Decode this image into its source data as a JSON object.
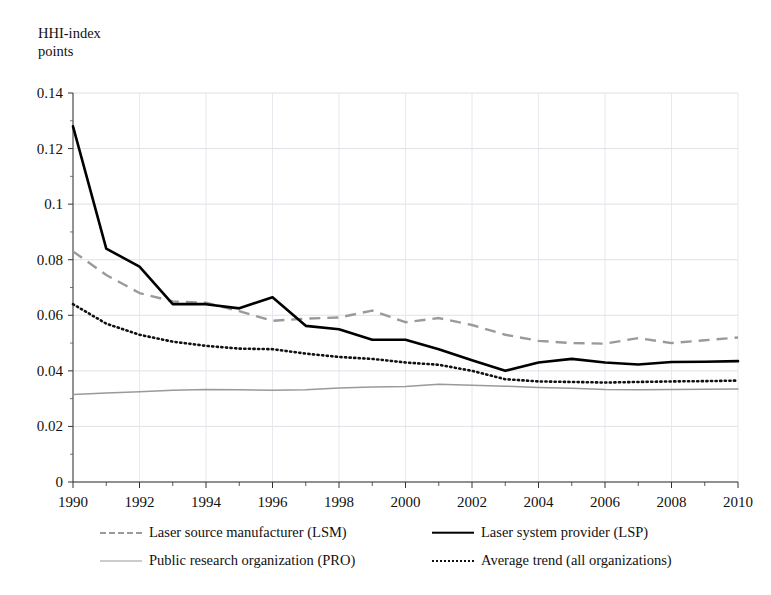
{
  "axis_title": "HHI-index\npoints",
  "legend": [
    {
      "key": "lsm",
      "label": "Laser source manufacturer (LSM)",
      "style": "dashed",
      "color": "#9a9a9a"
    },
    {
      "key": "lsp",
      "label": "Laser system provider (LSP)",
      "style": "solid-thick",
      "color": "#000000"
    },
    {
      "key": "pro",
      "label": "Public research organization (PRO)",
      "style": "solid-thin",
      "color": "#9a9a9a"
    },
    {
      "key": "avg",
      "label": "Average trend (all organizations)",
      "style": "dotted",
      "color": "#111111"
    }
  ],
  "chart_data": {
    "type": "line",
    "title": "",
    "xlabel": "",
    "ylabel": "HHI-index points",
    "xlim": [
      1990,
      2010
    ],
    "ylim": [
      0,
      0.14
    ],
    "ytick_labels": [
      "0",
      "0.02",
      "0.04",
      "0.06",
      "0.08",
      "0.1",
      "0.12",
      "0.14"
    ],
    "ytick_values": [
      0,
      0.02,
      0.04,
      0.06,
      0.08,
      0.1,
      0.12,
      0.14
    ],
    "xtick_labels": [
      "1990",
      "1992",
      "1994",
      "1996",
      "1998",
      "2000",
      "2002",
      "2004",
      "2006",
      "2008",
      "2010"
    ],
    "xtick_values": [
      1990,
      1992,
      1994,
      1996,
      1998,
      2000,
      2002,
      2004,
      2006,
      2008,
      2010
    ],
    "minor_xticks_every": 1,
    "grid": "horizontal-and-vertical-light",
    "legend_position": "bottom",
    "x": [
      1990,
      1991,
      1992,
      1993,
      1994,
      1995,
      1996,
      1997,
      1998,
      1999,
      2000,
      2001,
      2002,
      2003,
      2004,
      2005,
      2006,
      2007,
      2008,
      2009,
      2010
    ],
    "series": [
      {
        "name": "Laser source manufacturer (LSM)",
        "short": "LSM",
        "style": "dashed",
        "color": "#9a9a9a",
        "values": [
          0.083,
          0.0745,
          0.068,
          0.065,
          0.0645,
          0.0615,
          0.058,
          0.0588,
          0.0592,
          0.0617,
          0.0575,
          0.059,
          0.0565,
          0.053,
          0.0508,
          0.05,
          0.0498,
          0.0518,
          0.05,
          0.051,
          0.052
        ]
      },
      {
        "name": "Laser system provider (LSP)",
        "short": "LSP",
        "style": "solid-thick",
        "color": "#000000",
        "values": [
          0.128,
          0.084,
          0.0775,
          0.064,
          0.064,
          0.0625,
          0.0665,
          0.0562,
          0.055,
          0.0512,
          0.0512,
          0.0478,
          0.0438,
          0.04,
          0.043,
          0.0443,
          0.043,
          0.0423,
          0.0432,
          0.0433,
          0.0435
        ]
      },
      {
        "name": "Public research organization (PRO)",
        "short": "PRO",
        "style": "solid-thin",
        "color": "#9a9a9a",
        "values": [
          0.0315,
          0.032,
          0.0325,
          0.033,
          0.0333,
          0.0332,
          0.033,
          0.0332,
          0.0338,
          0.0342,
          0.0344,
          0.0352,
          0.0348,
          0.0345,
          0.034,
          0.0337,
          0.0333,
          0.0332,
          0.0333,
          0.0334,
          0.0335
        ]
      },
      {
        "name": "Average trend (all organizations)",
        "short": "Average trend",
        "style": "dotted",
        "color": "#111111",
        "values": [
          0.064,
          0.057,
          0.053,
          0.0505,
          0.049,
          0.048,
          0.0478,
          0.0462,
          0.045,
          0.0443,
          0.043,
          0.0422,
          0.04,
          0.037,
          0.0362,
          0.036,
          0.0358,
          0.036,
          0.0362,
          0.0363,
          0.0365
        ]
      }
    ]
  }
}
